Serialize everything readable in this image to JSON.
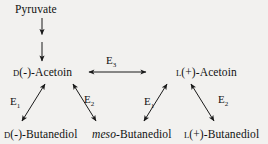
{
  "diagram": {
    "background_color": "#f2f1ef",
    "line_color": "#1a1a1a",
    "nodes": {
      "pyruvate": {
        "label": "Pyruvate"
      },
      "d_acetoin": {
        "prefix": "D",
        "label": "(-)-Acetoin"
      },
      "l_acetoin": {
        "prefix": "L",
        "label": "(+)-Acetoin"
      },
      "d_butanediol": {
        "prefix": "D",
        "label": "(-)-Butanediol"
      },
      "meso_butanediol": {
        "prefix": "meso",
        "label": "-Butanediol"
      },
      "l_butanediol": {
        "prefix": "L",
        "label": "(+)-Butanediol"
      }
    },
    "enzymes": {
      "e3": {
        "symbol": "E",
        "subscript": "3"
      },
      "e1_left": {
        "symbol": "E",
        "subscript": "1"
      },
      "e2_left": {
        "symbol": "E",
        "subscript": "2"
      },
      "e1_right": {
        "symbol": "E",
        "subscript": "1"
      },
      "e2_right": {
        "symbol": "E",
        "subscript": "2"
      }
    },
    "edges": [
      {
        "name": "pyruvate-to-acetoin-step-1",
        "from": "pyruvate",
        "to": "intermediate",
        "style": "single-headed",
        "direction": "down"
      },
      {
        "name": "pyruvate-to-acetoin-step-2",
        "from": "intermediate",
        "to": "d_acetoin",
        "style": "single-headed",
        "direction": "down"
      },
      {
        "name": "d-acetoin-l-acetoin",
        "from": "d_acetoin",
        "to": "l_acetoin",
        "style": "double-headed",
        "direction": "horizontal",
        "enzyme": "e3"
      },
      {
        "name": "d-butanediol-d-acetoin",
        "from": "d_butanediol",
        "to": "d_acetoin",
        "style": "double-headed",
        "direction": "diagonal-up-right",
        "enzyme": "e1_left"
      },
      {
        "name": "d-acetoin-meso-butanediol",
        "from": "d_acetoin",
        "to": "meso_butanediol",
        "style": "double-headed",
        "direction": "diagonal-down-right",
        "enzyme": "e2_left"
      },
      {
        "name": "meso-butanediol-l-acetoin",
        "from": "meso_butanediol",
        "to": "l_acetoin",
        "style": "double-headed",
        "direction": "diagonal-up-right",
        "enzyme": "e1_right"
      },
      {
        "name": "l-acetoin-l-butanediol",
        "from": "l_acetoin",
        "to": "l_butanediol",
        "style": "double-headed",
        "direction": "diagonal-down-right",
        "enzyme": "e2_right"
      }
    ]
  }
}
